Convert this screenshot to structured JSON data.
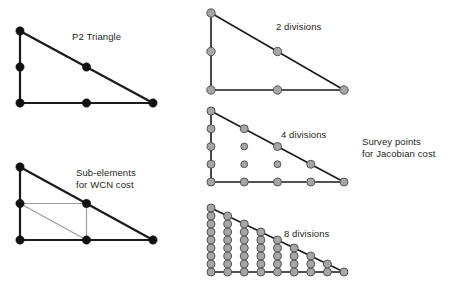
{
  "figure": {
    "background_color": "#ffffff",
    "width": 456,
    "height": 302,
    "labels": {
      "p2_triangle": "P2 Triangle",
      "sub_elements_line1": "Sub-elements",
      "sub_elements_line2": "for WCN cost",
      "divisions_2": "2 divisions",
      "divisions_4": "4 divisions",
      "divisions_8": "8 divisions",
      "survey_line1": "Survey points",
      "survey_line2": "for Jacobian cost"
    },
    "colors": {
      "edge_dark": "#1a1a1a",
      "edge_gray": "#9a9a9a",
      "node_dark_fill": "#111111",
      "node_gray_fill": "#a6a6a6",
      "node_gray_stroke": "#555555",
      "text": "#231f20"
    }
  },
  "chart_data": {
    "type": "diagram",
    "panels": [
      {
        "id": "p2-triangle",
        "label": "P2 Triangle",
        "node_style": "dark",
        "triangle": {
          "apex": [
            20,
            31
          ],
          "bottom_left": [
            20,
            103
          ],
          "bottom_right": [
            153,
            103
          ]
        },
        "node_radius": 4.2,
        "nodes": [
          [
            20,
            31
          ],
          [
            20,
            67
          ],
          [
            20,
            103
          ],
          [
            86.5,
            103
          ],
          [
            153,
            103
          ],
          [
            86.5,
            67
          ]
        ],
        "node_count": 6,
        "edges": [
          [
            [
              20,
              31
            ],
            [
              20,
              103
            ]
          ],
          [
            [
              20,
              103
            ],
            [
              153,
              103
            ]
          ],
          [
            [
              153,
              103
            ],
            [
              20,
              31
            ]
          ]
        ]
      },
      {
        "id": "sub-elements",
        "label_line1": "Sub-elements",
        "label_line2": "for WCN cost",
        "node_style": "dark",
        "triangle": {
          "apex": [
            20,
            167
          ],
          "bottom_left": [
            20,
            240
          ],
          "bottom_right": [
            153,
            240
          ]
        },
        "node_radius": 4.2,
        "nodes": [
          [
            20,
            167
          ],
          [
            20,
            203.5
          ],
          [
            20,
            240
          ],
          [
            86.5,
            240
          ],
          [
            153,
            240
          ],
          [
            86.5,
            203.5
          ]
        ],
        "node_count": 6,
        "edges": [
          [
            [
              20,
              167
            ],
            [
              20,
              240
            ]
          ],
          [
            [
              20,
              240
            ],
            [
              153,
              240
            ]
          ],
          [
            [
              153,
              240
            ],
            [
              20,
              167
            ]
          ]
        ],
        "sub_edges": [
          [
            [
              20,
              203.5
            ],
            [
              86.5,
              203.5
            ]
          ],
          [
            [
              86.5,
              203.5
            ],
            [
              86.5,
              240
            ]
          ],
          [
            [
              20,
              203.5
            ],
            [
              86.5,
              240
            ]
          ]
        ]
      },
      {
        "id": "divisions-2",
        "label": "2 divisions",
        "divisions": 2,
        "node_style": "gray",
        "triangle": {
          "apex": [
            211,
            13
          ],
          "bottom_left": [
            211,
            90
          ],
          "bottom_right": [
            344,
            90
          ]
        },
        "node_radius": 4.2,
        "node_count": 6,
        "edges": [
          [
            [
              211,
              13
            ],
            [
              211,
              90
            ]
          ],
          [
            [
              211,
              90
            ],
            [
              344,
              90
            ]
          ],
          [
            [
              344,
              90
            ],
            [
              211,
              13
            ]
          ]
        ]
      },
      {
        "id": "divisions-4",
        "label": "4 divisions",
        "divisions": 4,
        "node_style": "gray",
        "triangle": {
          "apex": [
            211,
            111
          ],
          "bottom_left": [
            211,
            182
          ],
          "bottom_right": [
            344,
            182
          ]
        },
        "node_radius": 4.0,
        "interior_node_radius": 3.4,
        "node_count": 15,
        "edges": [
          [
            [
              211,
              111
            ],
            [
              211,
              182
            ]
          ],
          [
            [
              211,
              182
            ],
            [
              344,
              182
            ]
          ],
          [
            [
              344,
              182
            ],
            [
              211,
              111
            ]
          ]
        ]
      },
      {
        "id": "divisions-8",
        "label": "8 divisions",
        "divisions": 8,
        "node_style": "gray",
        "triangle": {
          "apex": [
            211,
            208
          ],
          "bottom_left": [
            211,
            272
          ],
          "bottom_right": [
            344,
            272
          ]
        },
        "node_radius": 4.0,
        "node_count": 45,
        "edges": [
          [
            [
              211,
              208
            ],
            [
              211,
              272
            ]
          ],
          [
            [
              211,
              272
            ],
            [
              344,
              272
            ]
          ],
          [
            [
              344,
              272
            ],
            [
              211,
              208
            ]
          ]
        ]
      }
    ],
    "annotations": [
      {
        "id": "survey-points",
        "line1": "Survey points",
        "line2": "for Jacobian cost",
        "position": [
          362,
          136
        ]
      }
    ]
  }
}
